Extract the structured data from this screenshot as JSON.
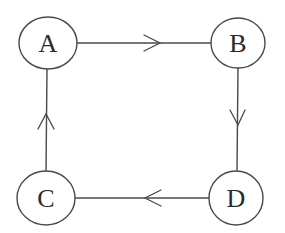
{
  "colors": {
    "stroke": "#4a4a4a",
    "text": "#2a2a2a",
    "background": "#ffffff"
  },
  "nodes": [
    {
      "id": "A",
      "label": "A",
      "cx": 48,
      "cy": 43,
      "rx": 29,
      "ry": 26
    },
    {
      "id": "B",
      "label": "B",
      "cx": 238,
      "cy": 43,
      "rx": 27,
      "ry": 25
    },
    {
      "id": "C",
      "label": "C",
      "cx": 46,
      "cy": 198,
      "rx": 29,
      "ry": 27
    },
    {
      "id": "D",
      "label": "D",
      "cx": 236,
      "cy": 198,
      "rx": 27,
      "ry": 27
    }
  ],
  "edges": [
    {
      "from": "A",
      "to": "B",
      "direction": "right"
    },
    {
      "from": "B",
      "to": "D",
      "direction": "down"
    },
    {
      "from": "D",
      "to": "C",
      "direction": "left"
    },
    {
      "from": "C",
      "to": "A",
      "direction": "up"
    }
  ]
}
